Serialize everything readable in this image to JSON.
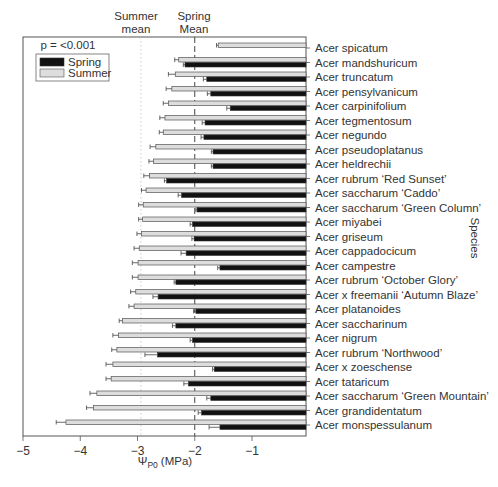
{
  "chart_data": {
    "type": "bar",
    "orientation": "horizontal",
    "title": "",
    "xlabel": "Ψ_P0 (MPa)",
    "xlabel_main": "Ψ",
    "xlabel_sub": "P0",
    "xlabel_unit": "(MPa)",
    "ylabel": "Species",
    "xlim": [
      -5,
      0
    ],
    "xticks": [
      -5,
      -4,
      -3,
      -2,
      -1
    ],
    "xtick_labels": [
      "−5",
      "−4",
      "−3",
      "−2",
      "−1"
    ],
    "grid": false,
    "legend": {
      "position": "upper left",
      "title": "p = <0.001",
      "entries": [
        {
          "name": "Spring",
          "color": "#111111"
        },
        {
          "name": "Summer",
          "color": "#dddddd"
        }
      ]
    },
    "reference_lines": [
      {
        "name": "Summer mean",
        "label_line1": "Summer",
        "label_line2": "mean",
        "x": -2.94,
        "style": "dotted"
      },
      {
        "name": "Spring Mean",
        "label_line1": "Spring",
        "label_line2": "Mean",
        "x": -2.0,
        "style": "dashed"
      }
    ],
    "categories": [
      "Acer spicatum",
      "Acer mandshuricum",
      "Acer truncatum",
      "Acer pensylvanicum",
      "Acer carpinifolium",
      "Acer tegmentosum",
      "Acer negundo",
      "Acer pseudoplatanus",
      "Acer heldrechii",
      "Acer rubrum ‘Red Sunset’",
      "Acer saccharum ‘Caddo’",
      "Acer saccharum ‘Green Column’",
      "Acer miyabei",
      "Acer griseum",
      "Acer cappadocicum",
      "Acer campestre",
      "Acer rubrum ‘October Glory’",
      "Acer x freemanii ‘Autumn Blaze’",
      "Acer platanoides",
      "Acer saccharinum",
      "Acer nigrum",
      "Acer rubrum ‘Northwood’",
      "Acer x zoeschense",
      "Acer tataricum",
      "Acer saccharum ‘Green Mountain’",
      "Acer grandidentatum",
      "Acer monspessulanum"
    ],
    "series": [
      {
        "name": "Summer",
        "color": "#dddddd",
        "values": [
          -1.59,
          -2.28,
          -2.34,
          -2.4,
          -2.46,
          -2.52,
          -2.55,
          -2.68,
          -2.72,
          -2.79,
          -2.85,
          -2.9,
          -2.91,
          -2.93,
          -2.97,
          -2.99,
          -2.99,
          -3.03,
          -3.06,
          -3.26,
          -3.33,
          -3.36,
          -3.43,
          -3.46,
          -3.71,
          -3.77,
          -4.25
        ],
        "errors": [
          0.03,
          0.07,
          0.12,
          0.1,
          0.09,
          0.09,
          0.07,
          0.1,
          0.08,
          0.1,
          0.08,
          0.08,
          0.07,
          0.08,
          0.09,
          0.1,
          0.1,
          0.09,
          0.09,
          0.06,
          0.1,
          0.09,
          0.12,
          0.09,
          0.12,
          0.12,
          0.17
        ]
      },
      {
        "name": "Spring",
        "color": "#111111",
        "values": [
          null,
          -2.17,
          -1.79,
          -1.72,
          -1.38,
          -1.82,
          -1.84,
          -1.68,
          -1.68,
          -2.49,
          -2.23,
          -1.96,
          -2.04,
          -2.01,
          -2.15,
          -1.56,
          -2.33,
          -2.64,
          -1.98,
          -2.33,
          -2.04,
          -2.65,
          -1.66,
          -2.11,
          -1.72,
          -1.88,
          -1.56
        ],
        "errors": [
          null,
          0.03,
          0.06,
          0.06,
          0.06,
          0.05,
          0.05,
          0.03,
          0.03,
          0.04,
          0.06,
          0.02,
          0.04,
          0.04,
          0.09,
          0.04,
          0.03,
          0.09,
          0.04,
          0.06,
          0.04,
          0.22,
          0.03,
          0.08,
          0.07,
          0.06,
          0.19
        ]
      }
    ]
  }
}
